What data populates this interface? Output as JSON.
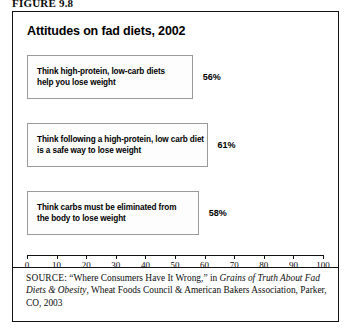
{
  "figure": {
    "label": "FIGURE 9.8"
  },
  "chart_data": {
    "type": "bar",
    "orientation": "horizontal",
    "title": "Attitudes on fad diets, 2002",
    "xlabel": "",
    "ylabel": "",
    "xlim": [
      0,
      100
    ],
    "grid": false,
    "legend": null,
    "categories": [
      "Think high-protein, low-carb diets\nhelp you lose weight",
      "Think following a high-protein, low carb diet\nis a safe way to lose weight",
      "Think carbs must be eliminated from\nthe body to lose weight"
    ],
    "values": [
      56,
      61,
      58
    ],
    "value_labels": [
      "56%",
      "61%",
      "58%"
    ],
    "tick_values": [
      0,
      10,
      20,
      30,
      40,
      50,
      60,
      70,
      80,
      90,
      100
    ],
    "tick_labels": [
      "0",
      "10",
      "20",
      "30",
      "40",
      "50",
      "60",
      "70",
      "80",
      "90",
      "100"
    ],
    "colors": {
      "bar_fill": "#fdfdfd",
      "bar_border": "#9a9a9a",
      "axis": "#111111",
      "text": "#000000",
      "frame": "#111111"
    }
  },
  "source": {
    "keyword": "SOURCE:",
    "text_part1": " “Where Consumers Have It Wrong,” in ",
    "italic1": "Grains of Truth About Fad Diets & Obesity",
    "text_part2": ", Wheat Foods Council & American Bakers Association, Parker, CO, 2003"
  }
}
